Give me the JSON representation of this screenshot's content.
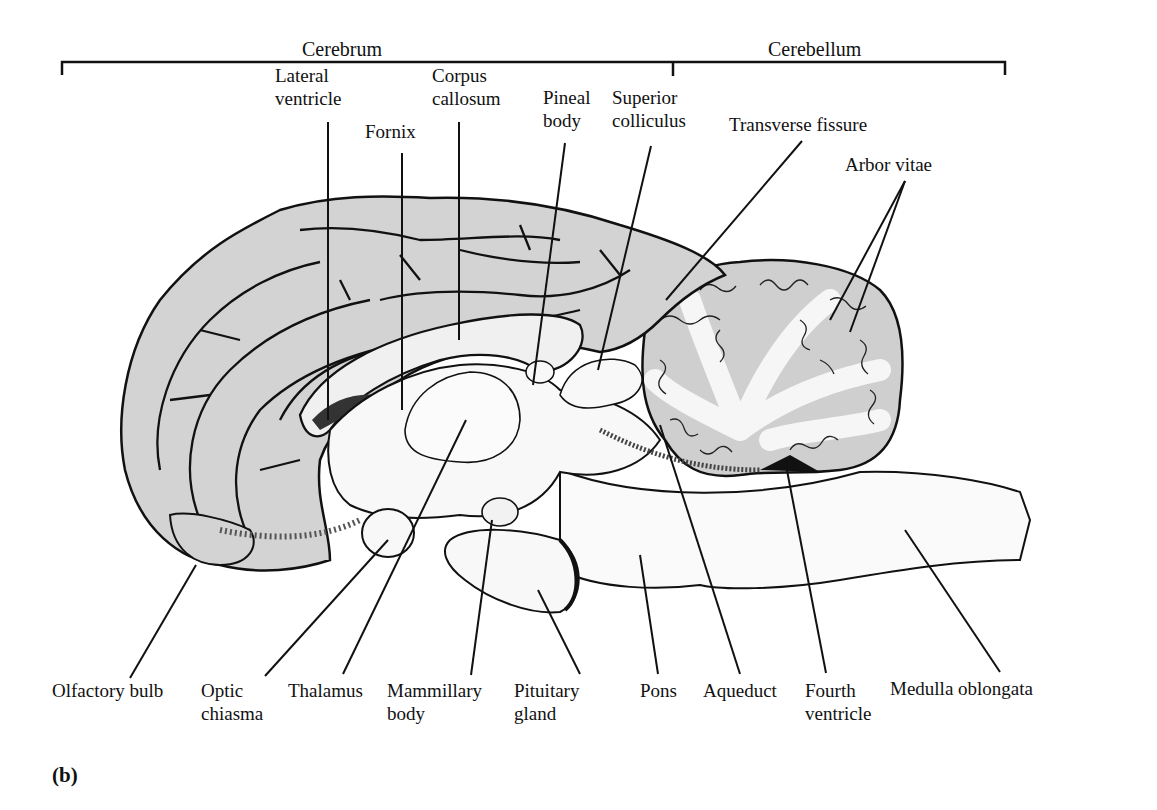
{
  "figure": {
    "panel_label": "(b)",
    "brackets": {
      "cerebrum": "Cerebrum",
      "cerebellum": "Cerebellum"
    },
    "colors": {
      "cortex_fill": "#d3d3d3",
      "white_matter": "#f4f4f4",
      "stroke": "#111111",
      "background": "#ffffff"
    },
    "labels_top": {
      "lateral_ventricle": [
        "Lateral",
        "ventricle"
      ],
      "fornix": [
        "Fornix"
      ],
      "corpus_callosum": [
        "Corpus",
        "callosum"
      ],
      "pineal_body": [
        "Pineal",
        "body"
      ],
      "superior_colliculus": [
        "Superior",
        "colliculus"
      ],
      "transverse_fissure": [
        "Transverse fissure"
      ],
      "arbor_vitae": [
        "Arbor vitae"
      ]
    },
    "labels_bottom": {
      "olfactory_bulb": [
        "Olfactory bulb"
      ],
      "optic_chiasma": [
        "Optic",
        "chiasma"
      ],
      "thalamus": [
        "Thalamus"
      ],
      "mammillary_body": [
        "Mammillary",
        "body"
      ],
      "pituitary_gland": [
        "Pituitary",
        "gland"
      ],
      "pons": [
        "Pons"
      ],
      "aqueduct": [
        "Aqueduct"
      ],
      "fourth_ventricle": [
        "Fourth",
        "ventricle"
      ],
      "medulla_oblongata": [
        "Medulla oblongata"
      ]
    }
  }
}
